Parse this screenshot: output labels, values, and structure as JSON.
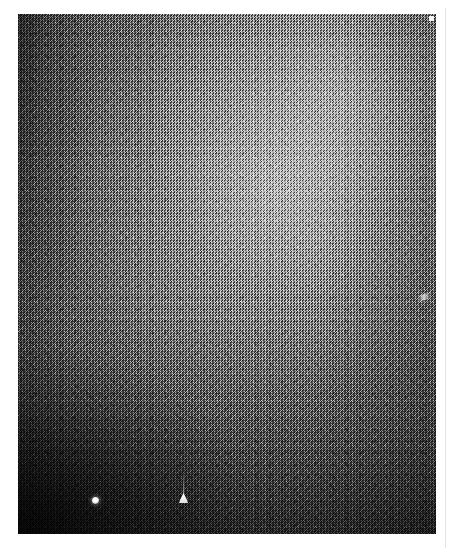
{
  "page": {
    "background_color": "#ffffff",
    "width": 453,
    "height": 557,
    "alt_text": ""
  },
  "plate": {
    "label": "grainy grayscale micrograph plate",
    "left": 18,
    "top": 14,
    "width": 418,
    "height": 520,
    "base_color": "#5b5b5b",
    "brightest_color": "#bdbdbd",
    "darkest_color": "#151515",
    "texture": "fine random film grain / speckle",
    "illumination": "bright diffuse centre and upper-right, strong falloff to lower-left corner and left edge"
  },
  "markers": [
    {
      "name": "bright-dot-marker",
      "shape": "circle",
      "color": "#ffffff",
      "left": 92,
      "top": 497,
      "size": 7
    },
    {
      "name": "bright-triangle-marker",
      "shape": "triangle",
      "color": "#ffffff",
      "left": 179,
      "top": 493,
      "size": 10,
      "has_tail": true
    }
  ],
  "artifacts": [
    {
      "name": "corner-fleck",
      "shape": "square",
      "color": "#f2f2f2",
      "left": 429,
      "top": 16
    },
    {
      "name": "edge-streak",
      "shape": "streak",
      "color": "#f0f0f0",
      "left": 418,
      "top": 294
    }
  ],
  "rule": {
    "name": "right-margin-rule",
    "color": "#e3e3e3",
    "left": 445,
    "top": 8,
    "height": 540
  }
}
